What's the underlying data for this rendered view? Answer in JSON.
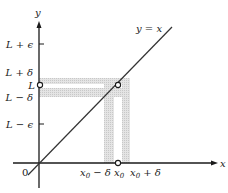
{
  "diagram": {
    "type": "function-limit-illustration",
    "function_label": "y = x",
    "axes": {
      "x_label": "x",
      "y_label": "y",
      "origin_label": "0"
    },
    "y_ticks": [
      {
        "label": "L + ϵ",
        "role": "upper-epsilon"
      },
      {
        "label": "L + δ",
        "role": "upper-delta"
      },
      {
        "label": "L",
        "role": "limit-value"
      },
      {
        "label": "L − δ",
        "role": "lower-delta"
      },
      {
        "label": "L − ϵ",
        "role": "lower-epsilon"
      }
    ],
    "x_ticks": [
      {
        "label_base": "x",
        "label_sub": "0",
        "label_tail": " − δ",
        "role": "left-delta"
      },
      {
        "label_base": "x",
        "label_sub": "0",
        "label_tail": "",
        "role": "x0"
      },
      {
        "label_base": "x",
        "label_sub": "0",
        "label_tail": " + δ",
        "role": "right-delta"
      }
    ],
    "points": [
      {
        "name": "hole-on-line",
        "description": "open circle at (x0, L)"
      },
      {
        "name": "hole-on-x-axis",
        "description": "open circle at x0"
      },
      {
        "name": "hole-on-y-axis",
        "description": "open circle at L"
      }
    ],
    "colors": {
      "axis": "#1a1a1a",
      "line": "#333333",
      "band": "#d9d9d9",
      "background": "#ffffff"
    }
  }
}
